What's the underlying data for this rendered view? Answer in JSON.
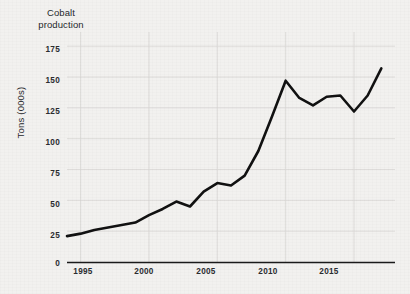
{
  "chart_data": {
    "type": "line",
    "title": "Cobalt production",
    "xlabel": "",
    "ylabel": "Tons (000s)",
    "ylim": [
      0,
      180
    ],
    "xlim": [
      1994,
      2018
    ],
    "grid": true,
    "legend": "none",
    "line_color": "#111111",
    "background_color": "#f2f1ef",
    "y_ticks": [
      0,
      25,
      50,
      75,
      100,
      125,
      150,
      175
    ],
    "y_tick_labels": [
      "0",
      "25",
      "50",
      "75",
      "100",
      "125",
      "150",
      "175"
    ],
    "x_ticks": [
      1995,
      2000,
      2005,
      2010,
      2015
    ],
    "x_tick_labels": [
      "1995",
      "2000",
      "2005",
      "2010",
      "2015"
    ],
    "x": [
      1994,
      1995,
      1996,
      1997,
      1998,
      1999,
      2000,
      2001,
      2002,
      2003,
      2004,
      2005,
      2006,
      2007,
      2008,
      2009,
      2010,
      2011,
      2012,
      2013,
      2014,
      2015,
      2016,
      2017
    ],
    "values": [
      21,
      23,
      26,
      28,
      30,
      32,
      38,
      43,
      49,
      45,
      57,
      64,
      62,
      70,
      90,
      118,
      147,
      133,
      127,
      134,
      135,
      122,
      135,
      157
    ],
    "series": [
      {
        "name": "Cobalt production",
        "values": [
          21,
          23,
          26,
          28,
          30,
          32,
          38,
          43,
          49,
          45,
          57,
          64,
          62,
          70,
          90,
          118,
          147,
          133,
          127,
          134,
          135,
          122,
          135,
          157
        ]
      }
    ]
  }
}
